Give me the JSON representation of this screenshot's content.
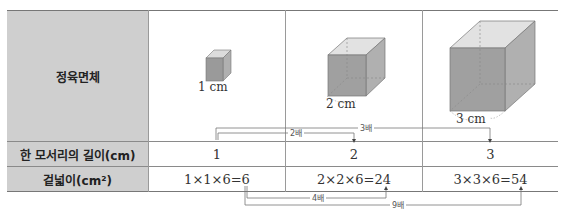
{
  "table": {
    "row_headers": {
      "cube": "정육면체",
      "edge_length": "한 모서리의 길이(cm)",
      "surface_area": "겉넓이(cm²)"
    },
    "columns": [
      {
        "cube_label": "1 cm",
        "edge_length": "1",
        "surface_area": "1×1×6=6"
      },
      {
        "cube_label": "2 cm",
        "edge_length": "2",
        "surface_area": "2×2×6=24"
      },
      {
        "cube_label": "3 cm",
        "edge_length": "3",
        "surface_area": "3×3×6=54"
      }
    ]
  },
  "annotations": {
    "edge_2x": "2배",
    "edge_3x": "3배",
    "area_4x": "4배",
    "area_9x": "9배"
  },
  "colors": {
    "header_bg": "#cfcfcf",
    "cube_front": "#9a9a9a",
    "cube_side": "#b0b0b0",
    "cube_top": "#dcdcdc"
  }
}
